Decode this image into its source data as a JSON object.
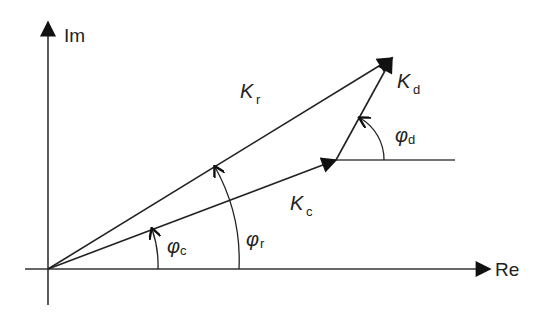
{
  "diagram": {
    "type": "phasor-diagram",
    "axes": {
      "x_label": "Re",
      "y_label": "Im"
    },
    "vectors": [
      {
        "name": "K",
        "subscript": "r",
        "description": "resultant vector from origin"
      },
      {
        "name": "K",
        "subscript": "c",
        "description": "vector from origin"
      },
      {
        "name": "K",
        "subscript": "d",
        "description": "vector from tip of K_c to tip of K_r"
      }
    ],
    "angles": [
      {
        "symbol": "φ",
        "subscript": "c",
        "description": "angle of K_c from Re axis"
      },
      {
        "symbol": "φ",
        "subscript": "r",
        "description": "angle of K_r from Re axis"
      },
      {
        "symbol": "φ",
        "subscript": "d",
        "description": "angle of K_d from horizontal reference"
      }
    ],
    "colors": {
      "stroke": "#222222",
      "background": "#ffffff"
    }
  }
}
